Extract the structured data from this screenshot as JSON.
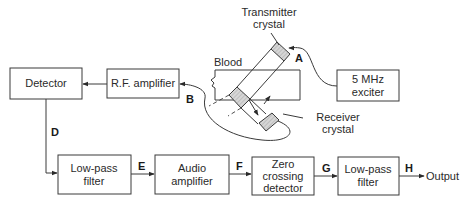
{
  "diagram": {
    "blocks": {
      "detector": {
        "lines": [
          "Detector"
        ]
      },
      "rf_amplifier": {
        "lines": [
          "R.F. amplifier"
        ]
      },
      "exciter": {
        "lines": [
          "5 MHz",
          "exciter"
        ]
      },
      "lpf1": {
        "lines": [
          "Low-pass",
          "filter"
        ]
      },
      "audio_amp": {
        "lines": [
          "Audio",
          "amplifier"
        ]
      },
      "zero_cross": {
        "lines": [
          "Zero",
          "crossing",
          "detector"
        ]
      },
      "lpf2": {
        "lines": [
          "Low-pass",
          "filter"
        ]
      }
    },
    "labels": {
      "transmitter": [
        "Transmitter",
        "crystal"
      ],
      "receiver": [
        "Receiver",
        "crystal"
      ],
      "blood": "Blood",
      "output": "Output"
    },
    "nodes": {
      "A": "A",
      "B": "B",
      "D": "D",
      "E": "E",
      "F": "F",
      "G": "G",
      "H": "H"
    },
    "connections": [
      {
        "from": "5 MHz exciter",
        "to": "Transmitter crystal",
        "node": "A"
      },
      {
        "from": "Receiver crystal",
        "to": "R.F. amplifier",
        "node": "B"
      },
      {
        "from": "R.F. amplifier",
        "to": "Detector"
      },
      {
        "from": "Detector",
        "to": "Low-pass filter",
        "node": "D"
      },
      {
        "from": "Low-pass filter",
        "to": "Audio amplifier",
        "node": "E"
      },
      {
        "from": "Audio amplifier",
        "to": "Zero crossing detector",
        "node": "F"
      },
      {
        "from": "Zero crossing detector",
        "to": "Low-pass filter",
        "node": "G"
      },
      {
        "from": "Low-pass filter",
        "to": "Output",
        "node": "H"
      }
    ]
  }
}
